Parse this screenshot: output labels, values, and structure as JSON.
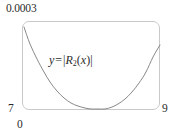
{
  "figure": {
    "name": "error-bound-plot",
    "labels": {
      "y_max": "0.0003",
      "y_min": "7",
      "x_min": "0",
      "x_max": "9"
    },
    "annotation": {
      "lhs": "y",
      "operator": "=",
      "open_bar": "|",
      "fn_name": "R",
      "subscript": "2",
      "arg_open": "(",
      "arg": "x",
      "arg_close": ")",
      "close_bar": "|",
      "full_text": "y = |R2(x)|"
    },
    "colors": {
      "frame": "#c9c9c9",
      "curve": "#7a7a7a",
      "text": "#2b2b2b",
      "background": "#ffffff"
    }
  },
  "chart_data": {
    "type": "line",
    "title": "",
    "xlabel": "",
    "ylabel": "",
    "xlim": [
      0,
      9
    ],
    "ylim": [
      7,
      0.0003
    ],
    "grid": false,
    "legend": "none",
    "annotations": [
      {
        "text": "y = |R2(x)|",
        "x": 2.0,
        "y": 0.000185
      }
    ],
    "axis_tick_labels": {
      "x": [
        "0",
        "9"
      ],
      "y": [
        "7",
        "0.0003"
      ]
    },
    "series": [
      {
        "name": "|R2(x)|",
        "x": [
          0.0,
          0.45,
          0.9,
          1.35,
          1.8,
          2.25,
          2.7,
          3.15,
          3.6,
          4.05,
          4.5,
          4.95,
          5.4,
          5.85,
          6.3,
          6.75,
          7.2,
          7.65,
          8.1,
          8.55,
          9.0
        ],
        "y": [
          0.000285,
          0.000228,
          0.000178,
          0.000135,
          0.0001,
          7.05e-05,
          4.75e-05,
          3e-05,
          1.72e-05,
          8.2e-06,
          2.8e-06,
          4e-07,
          1.2e-06,
          6.3e-06,
          1.65e-05,
          3.25e-05,
          5.55e-05,
          8.65e-05,
          0.000127,
          0.000178,
          0.000218
        ],
        "pixel_points": [
          [
            24,
            27
          ],
          [
            30,
            44
          ],
          [
            37,
            59
          ],
          [
            44,
            72
          ],
          [
            50,
            82
          ],
          [
            57,
            91
          ],
          [
            64,
            98
          ],
          [
            71,
            103
          ],
          [
            78,
            106
          ],
          [
            85,
            108
          ],
          [
            91,
            109
          ],
          [
            98,
            109
          ],
          [
            105,
            109
          ],
          [
            112,
            107
          ],
          [
            118,
            104
          ],
          [
            125,
            99
          ],
          [
            132,
            92
          ],
          [
            139,
            83
          ],
          [
            146,
            72
          ],
          [
            153,
            57
          ],
          [
            160,
            45
          ]
        ]
      }
    ]
  }
}
